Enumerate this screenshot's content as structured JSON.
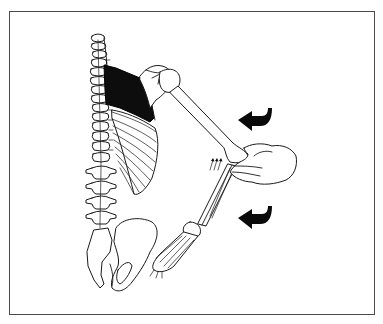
{
  "figure": {
    "type": "anatomical-illustration",
    "view": "posterior",
    "structures": [
      "spine",
      "ribcage",
      "scapula",
      "rhomboid-muscle-highlighted",
      "humerus",
      "forearm",
      "hand-skeleton",
      "pelvis",
      "examiner-hand"
    ],
    "highlighted_region": "rhomboid-muscle",
    "highlight_color": "#0d0d0d",
    "arrows": [
      {
        "name": "upper-curved-arrow",
        "direction": "left"
      },
      {
        "name": "lower-curved-arrow",
        "direction": "left"
      },
      {
        "name": "elbow-push-arrows",
        "direction": "up",
        "count": 3
      }
    ],
    "border_color": "#4a4a4a",
    "background": "#ffffff"
  }
}
